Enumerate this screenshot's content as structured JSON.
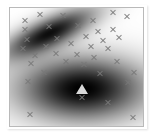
{
  "figure": {
    "width": 154,
    "height": 137,
    "background_color": "#ffffff",
    "border_color": "#b9b9b9",
    "title": "",
    "axis_labels_visible": false,
    "tick_labels_visible": false,
    "legend_visible": false
  },
  "chart_data": {
    "type": "heatmap",
    "title": "",
    "subtitle": "",
    "xlabel": "",
    "ylabel": "",
    "xlim": [
      0,
      1
    ],
    "ylim": [
      0,
      1
    ],
    "grid": false,
    "legend": null,
    "colormap": "grayscale",
    "colormap_low_color": "#ffffff",
    "colormap_high_color": "#000000",
    "density_components": [
      {
        "name": "component-1",
        "center_x_frac": 0.3,
        "center_y_frac": 0.21,
        "sigma_x_frac": 0.26,
        "sigma_y_frac": 0.085,
        "rotation_deg": -28,
        "peak_intensity": 0.92
      },
      {
        "name": "component-2",
        "center_x_frac": 0.545,
        "center_y_frac": 0.685,
        "sigma_x_frac": 0.33,
        "sigma_y_frac": 0.185,
        "rotation_deg": 0,
        "peak_intensity": 1.0
      }
    ],
    "scatter_marker": "x",
    "scatter_color": "#787878",
    "scatter_points": [
      {
        "x": 0.115,
        "y": 0.105
      },
      {
        "x": 0.225,
        "y": 0.055
      },
      {
        "x": 0.395,
        "y": 0.065
      },
      {
        "x": 0.625,
        "y": 0.105
      },
      {
        "x": 0.775,
        "y": 0.04
      },
      {
        "x": 0.88,
        "y": 0.075
      },
      {
        "x": 0.115,
        "y": 0.185
      },
      {
        "x": 0.295,
        "y": 0.155
      },
      {
        "x": 0.515,
        "y": 0.145
      },
      {
        "x": 0.66,
        "y": 0.195
      },
      {
        "x": 0.775,
        "y": 0.18
      },
      {
        "x": 0.13,
        "y": 0.265
      },
      {
        "x": 0.35,
        "y": 0.255
      },
      {
        "x": 0.575,
        "y": 0.245
      },
      {
        "x": 0.7,
        "y": 0.275
      },
      {
        "x": 0.82,
        "y": 0.25
      },
      {
        "x": 0.095,
        "y": 0.34
      },
      {
        "x": 0.27,
        "y": 0.33
      },
      {
        "x": 0.455,
        "y": 0.3
      },
      {
        "x": 0.61,
        "y": 0.33
      },
      {
        "x": 0.735,
        "y": 0.345
      },
      {
        "x": 0.185,
        "y": 0.4
      },
      {
        "x": 0.345,
        "y": 0.385
      },
      {
        "x": 0.5,
        "y": 0.39
      },
      {
        "x": 0.63,
        "y": 0.42
      },
      {
        "x": 0.155,
        "y": 0.47
      },
      {
        "x": 0.42,
        "y": 0.455
      },
      {
        "x": 0.56,
        "y": 0.48
      },
      {
        "x": 0.805,
        "y": 0.455
      },
      {
        "x": 0.255,
        "y": 0.545
      },
      {
        "x": 0.68,
        "y": 0.555
      },
      {
        "x": 0.93,
        "y": 0.545
      },
      {
        "x": 0.135,
        "y": 0.625
      },
      {
        "x": 0.885,
        "y": 0.63
      },
      {
        "x": 0.545,
        "y": 0.755
      },
      {
        "x": 0.74,
        "y": 0.8
      },
      {
        "x": 0.15,
        "y": 0.905
      },
      {
        "x": 0.925,
        "y": 0.93
      }
    ],
    "special_markers": [
      {
        "name": "mode-marker",
        "marker": "triangle",
        "x": 0.545,
        "y": 0.685,
        "color": "#d8d8d8"
      }
    ]
  }
}
